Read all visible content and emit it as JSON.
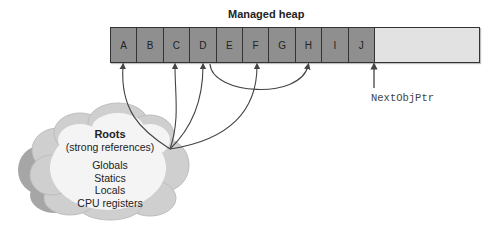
{
  "heap": {
    "title": "Managed heap",
    "objects": [
      "A",
      "B",
      "C",
      "D",
      "E",
      "F",
      "G",
      "H",
      "I",
      "J"
    ],
    "next_pointer_label": "NextObjPtr"
  },
  "roots": {
    "title": "Roots",
    "subtitle": "(strong references)",
    "items": [
      "Globals",
      "Statics",
      "Locals",
      "CPU registers"
    ],
    "references": [
      "A",
      "C",
      "D",
      "F"
    ]
  },
  "object_references": [
    {
      "from": "D",
      "to": "H"
    }
  ],
  "colors": {
    "object_fill": "#8f8f8f",
    "free_space": "#e2e2e2",
    "cloud_fill": "#f2f2f2",
    "cloud_shadow": "#a8a8a8",
    "line": "#444444"
  }
}
